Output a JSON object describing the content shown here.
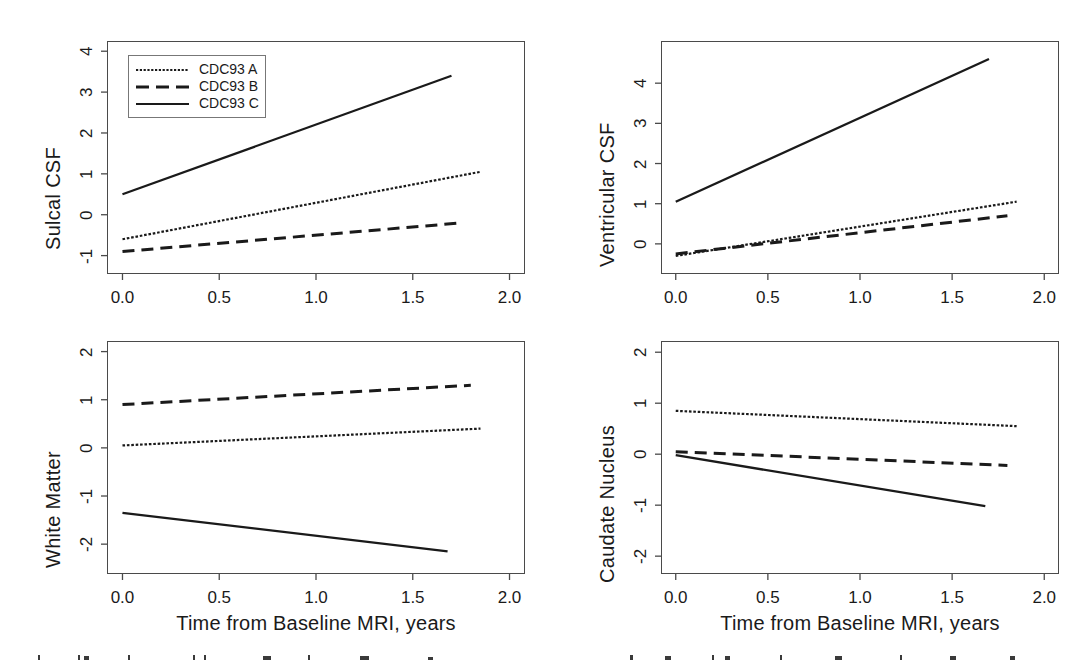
{
  "figure": {
    "background": "#ffffff",
    "line_color": "#1a1a1a",
    "frame_color": "#4a4a4a",
    "xlabel": "Time from Baseline MRI, years",
    "xticks": [
      "0.0",
      "0.5",
      "1.0",
      "1.5",
      "2.0"
    ],
    "legend": {
      "entries": [
        {
          "label": "CDC93 A",
          "style": "dotted"
        },
        {
          "label": "CDC93 B",
          "style": "dashed"
        },
        {
          "label": "CDC93 C",
          "style": "solid"
        }
      ]
    },
    "caption_fragment": "hanging indent caption line cropped at bottom edge"
  },
  "chart_data": [
    {
      "type": "line",
      "panel": "top-left",
      "title": "",
      "ylabel": "Sulcal CSF",
      "xlabel": "Time from Baseline MRI, years",
      "xticks": [
        0.0,
        0.5,
        1.0,
        1.5,
        2.0
      ],
      "yticks": [
        -1,
        0,
        1,
        2,
        3,
        4
      ],
      "xlim": [
        -0.08,
        2.08
      ],
      "ylim": [
        -1.45,
        4.25
      ],
      "grid": false,
      "legend_position": "top-left",
      "series": [
        {
          "name": "CDC93 A",
          "style": "dotted",
          "x": [
            0.0,
            1.85
          ],
          "values": [
            -0.6,
            1.05
          ]
        },
        {
          "name": "CDC93 B",
          "style": "dashed",
          "x": [
            0.0,
            1.75
          ],
          "values": [
            -0.9,
            -0.2
          ]
        },
        {
          "name": "CDC93 C",
          "style": "solid",
          "x": [
            0.0,
            1.7
          ],
          "values": [
            0.5,
            3.4
          ]
        }
      ]
    },
    {
      "type": "line",
      "panel": "top-right",
      "title": "",
      "ylabel": "Ventricular CSF",
      "xlabel": "Time from Baseline MRI, years",
      "xticks": [
        0.0,
        0.5,
        1.0,
        1.5,
        2.0
      ],
      "yticks": [
        0,
        1,
        2,
        3,
        4
      ],
      "xlim": [
        -0.08,
        2.08
      ],
      "ylim": [
        -0.75,
        5.05
      ],
      "grid": false,
      "legend_position": "none",
      "series": [
        {
          "name": "CDC93 A",
          "style": "dotted",
          "x": [
            0.0,
            1.85
          ],
          "values": [
            -0.3,
            1.05
          ]
        },
        {
          "name": "CDC93 B",
          "style": "dashed",
          "x": [
            0.0,
            1.8
          ],
          "values": [
            -0.25,
            0.7
          ]
        },
        {
          "name": "CDC93 C",
          "style": "solid",
          "x": [
            0.0,
            1.7
          ],
          "values": [
            1.05,
            4.6
          ]
        }
      ]
    },
    {
      "type": "line",
      "panel": "bottom-left",
      "title": "",
      "ylabel": "White Matter",
      "xlabel": "Time from Baseline MRI, years",
      "xticks": [
        0.0,
        0.5,
        1.0,
        1.5,
        2.0
      ],
      "yticks": [
        -2,
        -1,
        0,
        1,
        2
      ],
      "xlim": [
        -0.08,
        2.08
      ],
      "ylim": [
        -2.62,
        2.22
      ],
      "grid": false,
      "legend_position": "none",
      "series": [
        {
          "name": "CDC93 A",
          "style": "dotted",
          "x": [
            0.0,
            1.85
          ],
          "values": [
            0.05,
            0.4
          ]
        },
        {
          "name": "CDC93 B",
          "style": "dashed",
          "x": [
            0.0,
            1.8
          ],
          "values": [
            0.9,
            1.3
          ]
        },
        {
          "name": "CDC93 C",
          "style": "solid",
          "x": [
            0.0,
            1.68
          ],
          "values": [
            -1.35,
            -2.15
          ]
        }
      ]
    },
    {
      "type": "line",
      "panel": "bottom-right",
      "title": "",
      "ylabel": "Caudate Nucleus",
      "xlabel": "Time from Baseline MRI, years",
      "xticks": [
        0.0,
        0.5,
        1.0,
        1.5,
        2.0
      ],
      "yticks": [
        -2,
        -1,
        0,
        1,
        2
      ],
      "xlim": [
        -0.08,
        2.08
      ],
      "ylim": [
        -2.35,
        2.22
      ],
      "grid": false,
      "legend_position": "none",
      "series": [
        {
          "name": "CDC93 A",
          "style": "dotted",
          "x": [
            0.0,
            1.85
          ],
          "values": [
            0.85,
            0.55
          ]
        },
        {
          "name": "CDC93 B",
          "style": "dashed",
          "x": [
            0.0,
            1.8
          ],
          "values": [
            0.05,
            -0.22
          ]
        },
        {
          "name": "CDC93 C",
          "style": "solid",
          "x": [
            0.0,
            1.68
          ],
          "values": [
            -0.02,
            -1.02
          ]
        }
      ]
    }
  ]
}
